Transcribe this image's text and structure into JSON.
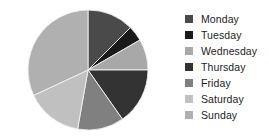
{
  "chart_data": {
    "type": "pie",
    "title": "",
    "categories": [
      "Monday",
      "Tuesday",
      "Wednesday",
      "Thursday",
      "Friday",
      "Saturday",
      "Sunday"
    ],
    "values": [
      12.5,
      4.2,
      8.3,
      15.3,
      12.5,
      15.3,
      31.9
    ],
    "angles_deg": [
      45,
      15,
      30,
      55,
      45,
      55,
      115
    ],
    "colors": [
      "#4a4a4a",
      "#1a1a1a",
      "#a8a8a8",
      "#333333",
      "#808080",
      "#c0c0c0",
      "#b0b0b0"
    ],
    "start_angle_deg": 0,
    "direction": "clockwise",
    "legend_position": "right",
    "grid": false,
    "xlabel": "",
    "ylabel": ""
  },
  "legend": {
    "items": [
      {
        "label": "Monday",
        "color": "#4a4a4a"
      },
      {
        "label": "Tuesday",
        "color": "#1a1a1a"
      },
      {
        "label": "Wednesday",
        "color": "#a8a8a8"
      },
      {
        "label": "Thursday",
        "color": "#333333"
      },
      {
        "label": "Friday",
        "color": "#808080"
      },
      {
        "label": "Saturday",
        "color": "#c0c0c0"
      },
      {
        "label": "Sunday",
        "color": "#b0b0b0"
      }
    ]
  },
  "pie": {
    "center_x": 88,
    "center_y": 70,
    "radius": 60
  }
}
